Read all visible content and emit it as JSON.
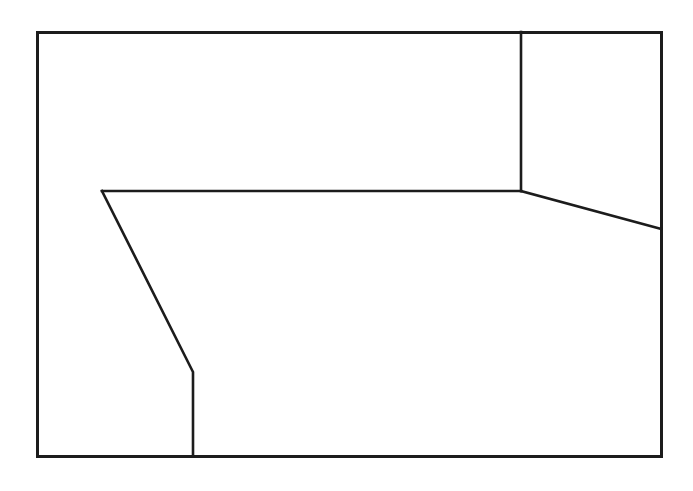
{
  "document": {
    "type": "scanned-page-figure",
    "background_color": "#ffffff",
    "width": 693,
    "height": 491
  },
  "header": {
    "clipped_text_remnant": "図二四　庭園の平面図　庭の境界線と区画の配置",
    "note_visible": "bottom edge of one cropped text line only",
    "color": "#3a3a40"
  },
  "figure": {
    "name": "line-drawing-plan",
    "stroke_color": "#1c1c1c",
    "fill_color": "#ffffff",
    "outer_stroke_width": 3,
    "inner_stroke_width": 2.6,
    "outer_rect": {
      "left": 37,
      "top": 32,
      "right": 661,
      "bottom": 456,
      "width": 624,
      "height": 424
    },
    "paths": [
      {
        "name": "upper-right-divider",
        "description": "vertical line from top edge down to interior junction",
        "points": [
          [
            521,
            32
          ],
          [
            521,
            191
          ]
        ]
      },
      {
        "name": "mid-horizontal-edge",
        "description": "horizontal line from left bend to interior junction",
        "points": [
          [
            102,
            191
          ],
          [
            521,
            191
          ]
        ]
      },
      {
        "name": "right-slanted-edge",
        "description": "diagonal from interior junction down to right border",
        "points": [
          [
            521,
            191
          ],
          [
            661,
            229
          ]
        ]
      },
      {
        "name": "left-slanted-edge",
        "description": "diagonal descending from left bend to lower bend",
        "points": [
          [
            102,
            191
          ],
          [
            193,
            372
          ]
        ]
      },
      {
        "name": "lower-vertical-edge",
        "description": "vertical line from lower bend to bottom border",
        "points": [
          [
            193,
            372
          ],
          [
            193,
            456
          ]
        ]
      }
    ],
    "vertices": [
      {
        "name": "top-left-corner",
        "x": 37,
        "y": 32
      },
      {
        "name": "top-right-corner",
        "x": 661,
        "y": 32
      },
      {
        "name": "bottom-right-corner",
        "x": 661,
        "y": 456
      },
      {
        "name": "bottom-left-corner",
        "x": 37,
        "y": 456
      },
      {
        "name": "top-divider-anchor",
        "x": 521,
        "y": 32
      },
      {
        "name": "interior-junction",
        "x": 521,
        "y": 191
      },
      {
        "name": "right-border-meet",
        "x": 661,
        "y": 229
      },
      {
        "name": "left-bend",
        "x": 102,
        "y": 191
      },
      {
        "name": "lower-bend",
        "x": 193,
        "y": 372
      },
      {
        "name": "bottom-border-meet",
        "x": 193,
        "y": 456
      }
    ],
    "regions": [
      {
        "name": "upper-left-region",
        "label": ""
      },
      {
        "name": "upper-right-region",
        "label": ""
      },
      {
        "name": "central-region",
        "label": ""
      },
      {
        "name": "lower-left-region",
        "label": ""
      },
      {
        "name": "lower-right-region",
        "label": ""
      }
    ]
  }
}
